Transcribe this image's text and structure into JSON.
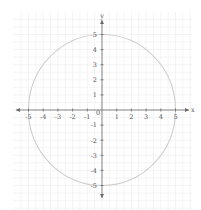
{
  "chart_data": {
    "type": "line",
    "title": "",
    "xlabel": "x",
    "ylabel": "y",
    "xlim": [
      -5.9,
      6.0
    ],
    "ylim": [
      -6.6,
      6.5
    ],
    "grid": true,
    "grid_minor_step": 0.5,
    "x_ticks": [
      -5,
      -4,
      -3,
      -2,
      -1,
      1,
      2,
      3,
      4,
      5
    ],
    "x_tick_labels": [
      "-5",
      "-4",
      "-3",
      "-2",
      "-1",
      "1",
      "2",
      "3",
      "4",
      "5"
    ],
    "y_ticks": [
      5,
      4,
      3,
      2,
      1,
      -1,
      -2,
      -3,
      -4,
      -5
    ],
    "y_tick_labels": [
      "5",
      "4",
      "3",
      "2",
      "1",
      "-1",
      "-2",
      "-3",
      "-4",
      "-5"
    ],
    "origin_label": "0",
    "series": [
      {
        "name": "circle",
        "equation": "x^2 + y^2 = 25",
        "center": [
          0,
          0
        ],
        "radius": 5,
        "color": "#cfcfcf"
      }
    ],
    "colors": {
      "axis": "#6a6a6a",
      "grid": "#ececec",
      "text": "#555555"
    }
  }
}
